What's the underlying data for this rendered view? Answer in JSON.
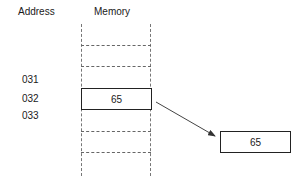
{
  "headers": {
    "address": "Address",
    "memory": "Memory"
  },
  "addresses": [
    {
      "label": "031"
    },
    {
      "label": "032"
    },
    {
      "label": "033"
    }
  ],
  "memory_cell": {
    "address": "032",
    "value": "65"
  },
  "destination": {
    "value": "65"
  },
  "arrow": {
    "from": "memory-cell-032",
    "to": "destination-box"
  }
}
